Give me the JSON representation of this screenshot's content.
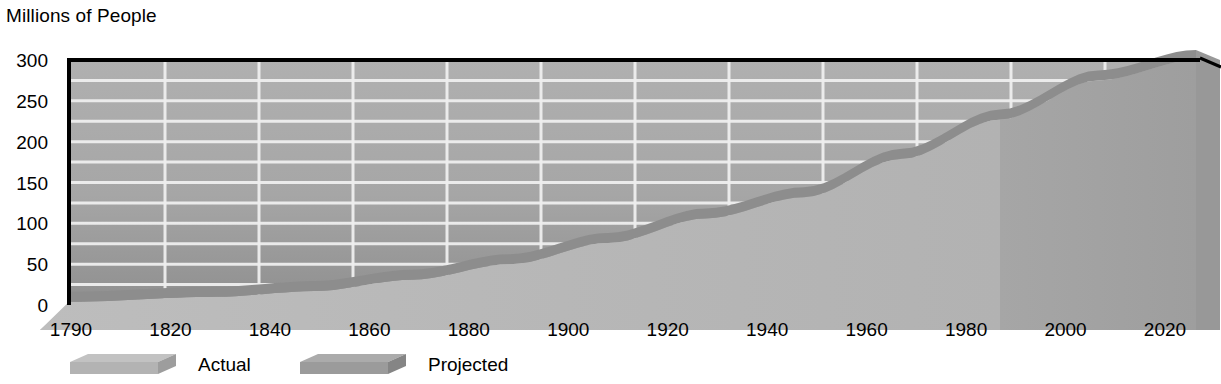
{
  "chart_data": {
    "type": "area",
    "title": "",
    "ylabel": "Millions of People",
    "xlabel": "",
    "ylim": [
      0,
      300
    ],
    "yticks": [
      0,
      50,
      100,
      150,
      200,
      250,
      300
    ],
    "gridline_step": 25,
    "grid": true,
    "style": "3d-area",
    "x": [
      1790,
      1820,
      1840,
      1860,
      1880,
      1900,
      1920,
      1940,
      1960,
      1980,
      2000,
      2020
    ],
    "categories": [
      "1790",
      "1820",
      "1840",
      "1860",
      "1880",
      "1900",
      "1920",
      "1940",
      "1960",
      "1980",
      "2000",
      "2020"
    ],
    "values": [
      4,
      10,
      17,
      31,
      50,
      76,
      106,
      132,
      179,
      227,
      275,
      300
    ],
    "series": [
      {
        "name": "Actual",
        "x": [
          1790,
          1820,
          1840,
          1860,
          1880,
          1900,
          1920,
          1940,
          1960,
          1980
        ],
        "values": [
          4,
          10,
          17,
          31,
          50,
          76,
          106,
          132,
          179,
          227
        ]
      },
      {
        "name": "Projected",
        "x": [
          1980,
          2000,
          2020
        ],
        "values": [
          227,
          275,
          300
        ]
      }
    ],
    "legend": {
      "position": "bottom",
      "entries": [
        {
          "label": "Actual",
          "color": "#b9b9b9"
        },
        {
          "label": "Projected",
          "color": "#9a9a9a"
        }
      ]
    },
    "colors": {
      "wall": "#a8a8a8",
      "floor": "#b0b0b0",
      "gridline": "#f0f0f0",
      "actual_front": "#b9b9b9",
      "projected_front": "#a2a2a2",
      "ribbon_top": "#8d8d8d",
      "endcap": "#989898",
      "frame": "#000000",
      "text": "#000000"
    }
  },
  "legend": {
    "actual_label": "Actual",
    "projected_label": "Projected"
  },
  "axis": {
    "y_title": "Millions of People"
  }
}
